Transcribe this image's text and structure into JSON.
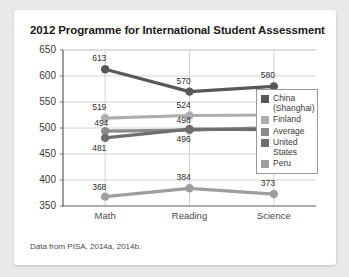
{
  "card": {
    "title": "2012 Programme for International Student Assessment",
    "footnote": "Data from PISA, 2014a, 2014b."
  },
  "legend": {
    "items": [
      {
        "label": "China\n(Shanghai)",
        "color": "#585858"
      },
      {
        "label": "Finland",
        "color": "#aeaeae"
      },
      {
        "label": "Average",
        "color": "#8a8a8a"
      },
      {
        "label": "United\nStates",
        "color": "#6e6e6e"
      },
      {
        "label": "Peru",
        "color": "#9e9e9e"
      }
    ]
  },
  "axis": {
    "y_ticks": [
      "650",
      "600",
      "550",
      "500",
      "450",
      "400",
      "350"
    ],
    "x_ticks": [
      "Math",
      "Reading",
      "Science"
    ]
  },
  "chart_data": {
    "type": "line",
    "title": "2012 Programme for International Student Assessment",
    "xlabel": "",
    "ylabel": "",
    "ylim": [
      350,
      650
    ],
    "ytick_step": 50,
    "grid": true,
    "legend_position": "right",
    "categories": [
      "Math",
      "Reading",
      "Science"
    ],
    "series": [
      {
        "name": "China (Shanghai)",
        "color": "#585858",
        "values": [
          613,
          570,
          580
        ]
      },
      {
        "name": "Finland",
        "color": "#aeaeae",
        "values": [
          519,
          524,
          525
        ]
      },
      {
        "name": "Average",
        "color": "#8a8a8a",
        "values": [
          494,
          496,
          501
        ]
      },
      {
        "name": "United States",
        "color": "#6e6e6e",
        "values": [
          481,
          498,
          497
        ]
      },
      {
        "name": "Peru",
        "color": "#9e9e9e",
        "values": [
          368,
          384,
          373
        ]
      }
    ],
    "data_labels": [
      {
        "series": "China (Shanghai)",
        "category": "Math",
        "text": "613"
      },
      {
        "series": "China (Shanghai)",
        "category": "Reading",
        "text": "570"
      },
      {
        "series": "China (Shanghai)",
        "category": "Science",
        "text": "580"
      },
      {
        "series": "Finland",
        "category": "Math",
        "text": "519"
      },
      {
        "series": "Finland",
        "category": "Reading",
        "text": "524"
      },
      {
        "series": "Finland",
        "category": "Science",
        "text": "525"
      },
      {
        "series": "Average",
        "category": "Math",
        "text": "494"
      },
      {
        "series": "Average",
        "category": "Reading",
        "text": "496"
      },
      {
        "series": "Average",
        "category": "Science",
        "text": "501"
      },
      {
        "series": "United States",
        "category": "Math",
        "text": "481"
      },
      {
        "series": "United States",
        "category": "Reading",
        "text": "498"
      },
      {
        "series": "United States",
        "category": "Science",
        "text": "497"
      },
      {
        "series": "Peru",
        "category": "Math",
        "text": "368"
      },
      {
        "series": "Peru",
        "category": "Reading",
        "text": "384"
      },
      {
        "series": "Peru",
        "category": "Science",
        "text": "373"
      }
    ]
  }
}
